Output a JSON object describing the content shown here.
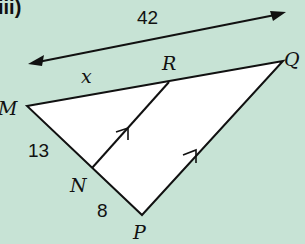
{
  "question_label": "iii)",
  "measure_top": "42",
  "labels": {
    "x": "x",
    "M": "M",
    "R": "R",
    "Q": "Q",
    "N": "N",
    "P": "P",
    "MN": "13",
    "NP": "8"
  },
  "colors": {
    "background": "#c7e3d5",
    "triangle_fill": "#ffffff",
    "stroke": "#111111"
  }
}
